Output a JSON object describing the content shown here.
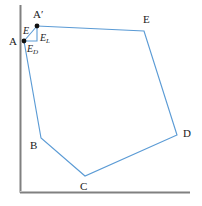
{
  "figure": {
    "type": "geometry-diagram",
    "colors": {
      "traverse_line": "#5B9BD5",
      "axis": "#808080",
      "axis_shadow": "#4d4d4d",
      "label_text": "#1a1a1a",
      "vertex_dot": "#111111",
      "background": "#ffffff"
    },
    "axes": {
      "vertical": {
        "x": 20,
        "y_top": 5,
        "y_bottom": 192
      },
      "horizontal": {
        "y": 192,
        "x_left": 20,
        "x_right": 190
      }
    },
    "vertices": [
      {
        "name": "A-prime",
        "label": "A",
        "prime": "′",
        "x": 37,
        "y": 26,
        "label_x": 33,
        "label_y": 9,
        "dot": true
      },
      {
        "name": "E",
        "label": "E",
        "x": 144,
        "y": 31,
        "label_x": 143,
        "label_y": 14,
        "dot": false
      },
      {
        "name": "D",
        "label": "D",
        "x": 177,
        "y": 135,
        "label_x": 183,
        "label_y": 128,
        "dot": false
      },
      {
        "name": "C",
        "label": "C",
        "x": 85,
        "y": 176,
        "label_x": 80,
        "label_y": 181,
        "dot": false
      },
      {
        "name": "B",
        "label": "B",
        "x": 41,
        "y": 138,
        "label_x": 30,
        "label_y": 140,
        "dot": false
      },
      {
        "name": "A",
        "label": "A",
        "x": 24,
        "y": 41,
        "label_x": 9,
        "label_y": 36,
        "dot": true
      }
    ],
    "error_triangle": {
      "corner_x": 37,
      "corner_y": 41,
      "labels": [
        {
          "name": "error-total",
          "base": "E",
          "sub": "",
          "x": 23,
          "y": 26
        },
        {
          "name": "error-latitude",
          "base": "E",
          "sub": "L",
          "x": 40,
          "y": 33
        },
        {
          "name": "error-departure",
          "base": "E",
          "sub": "D",
          "x": 27,
          "y": 44
        }
      ]
    },
    "traverse_path": "37,26 144,31 177,135 85,176 41,138 24,41"
  }
}
